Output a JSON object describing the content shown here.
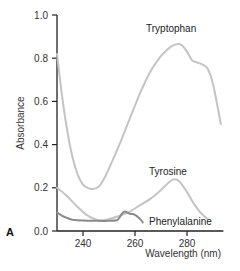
{
  "chart_data": {
    "type": "line",
    "title": "",
    "panel_label": "A",
    "xlabel": "Wavelength (nm)",
    "ylabel": "Absorbance",
    "xlim": [
      230,
      294
    ],
    "ylim": [
      0.0,
      1.0
    ],
    "x_ticks": [
      240,
      260,
      280
    ],
    "x_tick_labels": [
      "240",
      "260",
      "280"
    ],
    "y_ticks": [
      0.0,
      0.2,
      0.4,
      0.6,
      0.8,
      1.0
    ],
    "y_tick_labels": [
      "0.0",
      "0.2",
      "0.4",
      "0.6",
      "0.8",
      "1.0"
    ],
    "grid": false,
    "legend": "none (direct labels)",
    "series": [
      {
        "name": "Tryptophan",
        "label": "Tryptophan",
        "color": "#c4c4c4",
        "x": [
          230,
          232,
          234,
          236,
          238,
          240,
          242,
          244,
          246,
          248,
          250,
          254,
          258,
          262,
          266,
          270,
          272,
          274,
          276,
          278,
          280,
          282,
          284,
          286,
          288,
          290,
          292,
          293
        ],
        "y": [
          0.82,
          0.62,
          0.46,
          0.34,
          0.26,
          0.215,
          0.198,
          0.195,
          0.205,
          0.24,
          0.29,
          0.4,
          0.52,
          0.64,
          0.74,
          0.81,
          0.835,
          0.855,
          0.865,
          0.86,
          0.83,
          0.79,
          0.78,
          0.77,
          0.75,
          0.68,
          0.56,
          0.495
        ]
      },
      {
        "name": "Tyrosine",
        "label": "Tyrosine",
        "color": "#c4c4c4",
        "x": [
          230,
          234,
          238,
          242,
          246,
          250,
          254,
          258,
          262,
          266,
          270,
          273,
          275,
          277,
          280,
          283,
          286,
          288
        ],
        "y": [
          0.2,
          0.16,
          0.11,
          0.07,
          0.05,
          0.055,
          0.07,
          0.09,
          0.12,
          0.15,
          0.19,
          0.225,
          0.24,
          0.23,
          0.18,
          0.12,
          0.075,
          0.055
        ]
      },
      {
        "name": "Phenylalanine",
        "label": "Phenylalanine",
        "color": "#8a8a8a",
        "x": [
          230,
          232,
          234,
          236,
          240,
          245,
          250,
          253,
          254,
          255,
          256,
          257,
          258,
          260,
          262,
          263
        ],
        "y": [
          0.085,
          0.07,
          0.06,
          0.052,
          0.048,
          0.047,
          0.047,
          0.05,
          0.062,
          0.08,
          0.09,
          0.085,
          0.08,
          0.075,
          0.055,
          0.04
        ]
      }
    ],
    "annotations": [
      {
        "text": "Tryptophan",
        "near_x": 275,
        "near_y": 0.93
      },
      {
        "text": "Tyrosine",
        "near_x": 275,
        "near_y": 0.3
      },
      {
        "text": "Phenylalanine",
        "near_x": 274,
        "near_y": 0.03
      }
    ]
  }
}
